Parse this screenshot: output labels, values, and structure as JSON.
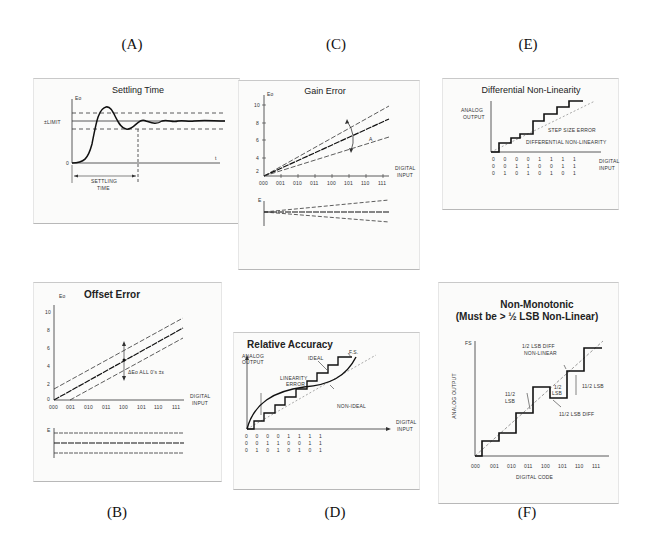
{
  "panels": {
    "A": {
      "label": "(A)",
      "title": "Settling Time",
      "y_axis": "Eo",
      "x_axis": "t",
      "limit_label": "±LIMIT",
      "zero_label": "0",
      "settling_label_1": "SETTLING",
      "settling_label_2": "TIME"
    },
    "B": {
      "label": "(B)",
      "title": "Offset Error",
      "y_axis": "Eo",
      "y_ticks": [
        "10",
        "8",
        "6",
        "4",
        "2",
        "0"
      ],
      "x_ticks": [
        "000",
        "001",
        "010",
        "011",
        "100",
        "101",
        "110",
        "111"
      ],
      "x_axis_1": "DIGITAL",
      "x_axis_2": "INPUT",
      "annotation": "ΔEo  ALL 0's  ±ε",
      "error_axis": "E"
    },
    "C": {
      "label": "(C)",
      "title": "Gain Error",
      "y_axis": "Eo",
      "y_ticks": [
        "10",
        "8",
        "6",
        "4",
        "2"
      ],
      "x_ticks": [
        "000",
        "001",
        "010",
        "011",
        "100",
        "101",
        "110",
        "111"
      ],
      "x_axis_1": "DIGITAL",
      "x_axis_2": "INPUT",
      "annotation": "A",
      "error_axis": "E"
    },
    "D": {
      "label": "(D)",
      "title": "Relative Accuracy",
      "y_axis_1": "ANALOG",
      "y_axis_2": "OUTPUT",
      "ideal_label": "IDEAL",
      "fs_label": "F.S.",
      "linearity_1": "LINEARITY",
      "linearity_2": "ERROR",
      "nonideal_label": "NON-IDEAL",
      "x_axis_1": "DIGITAL",
      "x_axis_2": "INPUT",
      "bit_rows": [
        [
          "0",
          "0",
          "0",
          "0",
          "1",
          "1",
          "1",
          "1"
        ],
        [
          "0",
          "0",
          "1",
          "1",
          "0",
          "0",
          "1",
          "1"
        ],
        [
          "0",
          "1",
          "0",
          "1",
          "0",
          "1",
          "0",
          "1"
        ]
      ]
    },
    "E": {
      "label": "(E)",
      "title": "Differential Non-Linearity",
      "y_axis_1": "ANALOG",
      "y_axis_2": "OUTPUT",
      "step_label": "STEP SIZE ERROR",
      "dnl_label": "DIFFERENTIAL NON-LINEARITY",
      "x_axis_1": "DIGITAL",
      "x_axis_2": "INPUT",
      "bit_rows": [
        [
          "0",
          "0",
          "0",
          "0",
          "1",
          "1",
          "1",
          "1"
        ],
        [
          "0",
          "0",
          "1",
          "1",
          "0",
          "0",
          "1",
          "1"
        ],
        [
          "0",
          "1",
          "0",
          "1",
          "0",
          "1",
          "0",
          "1"
        ]
      ]
    },
    "F": {
      "label": "(F)",
      "title_1": "Non-Monotonic",
      "title_2": "(Must be > ½ LSB Non-Linear)",
      "fs_label": "FS",
      "y_axis": "ANALOG OUTPUT",
      "ann_diff_1": "1/2 LSB DIFF",
      "ann_diff_2": "NON-LINEAR",
      "ann_112_a_1": "11/2",
      "ann_112_a_2": "LSB",
      "ann_12_1": "1/2",
      "ann_12_2": "LSB",
      "ann_112_b": "11/2 LSB",
      "ann_112_diff": "11/2 LSB DIFF",
      "x_ticks": [
        "000",
        "001",
        "010",
        "011",
        "100",
        "101",
        "110",
        "111"
      ],
      "x_axis": "DIGITAL CODE"
    }
  }
}
